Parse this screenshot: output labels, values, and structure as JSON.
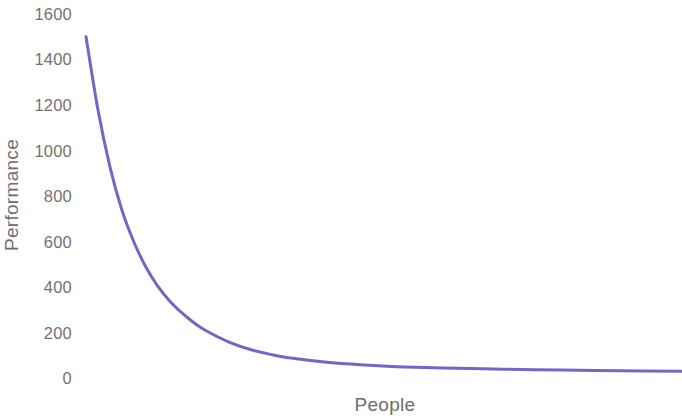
{
  "chart_data": {
    "type": "line",
    "title": "",
    "subtitle": "",
    "xlabel": "People",
    "ylabel": "Performance",
    "xlim": [
      0,
      100
    ],
    "ylim": [
      0,
      1600
    ],
    "grid": false,
    "legend": false,
    "legend_position": "none",
    "x_tick_labels": [],
    "y_tick_labels": [
      "1600",
      "1400",
      "1200",
      "1000",
      "800",
      "600",
      "400",
      "200",
      "0"
    ],
    "y_ticks": [
      1600,
      1400,
      1200,
      1000,
      800,
      600,
      400,
      200,
      0
    ],
    "series": [
      {
        "name": "Performance",
        "color": "#6f68c6",
        "line_width": 3,
        "x": [
          0,
          2,
          4,
          6,
          8,
          10,
          12,
          14,
          16,
          18,
          20,
          24,
          28,
          32,
          36,
          40,
          46,
          52,
          60,
          70,
          80,
          90,
          100
        ],
        "values": [
          1500,
          1180,
          930,
          740,
          600,
          490,
          405,
          340,
          288,
          245,
          210,
          158,
          122,
          98,
          82,
          70,
          58,
          50,
          44,
          39,
          35,
          32,
          30
        ]
      }
    ],
    "annotations": []
  },
  "axes": {
    "y_title": "Performance",
    "x_title": "People"
  },
  "style": {
    "background": "#ffffff",
    "tick_label_color": "#727272",
    "axis_title_color": "#6d6d6d",
    "curve_color": "#6f68c6",
    "gridline_color": "#fbfbfc"
  }
}
